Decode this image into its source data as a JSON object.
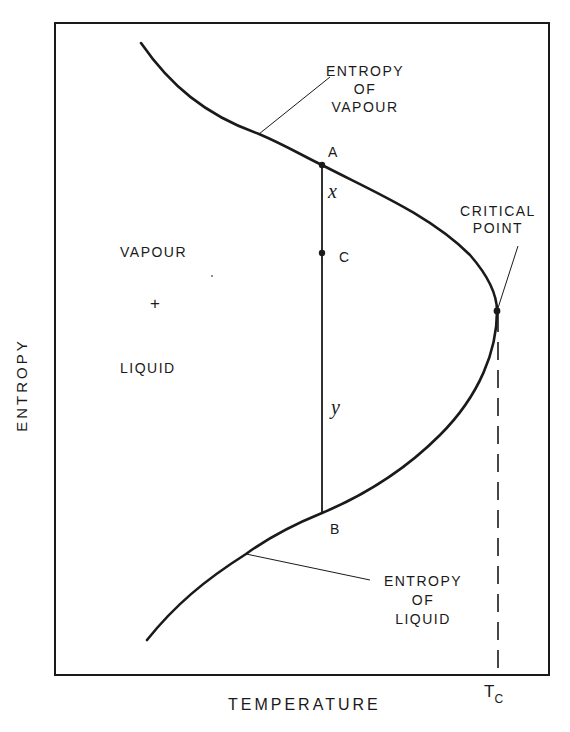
{
  "diagram": {
    "type": "temperature-entropy phase diagram",
    "axes": {
      "x_label": "TEMPERATURE",
      "y_label": "ENTROPY",
      "x_tick": {
        "main": "T",
        "subscript": "C"
      }
    },
    "regions": {
      "two_phase": {
        "line1": "VAPOUR",
        "line2": "+",
        "line3": "LIQUID"
      }
    },
    "curves": {
      "vapour": {
        "line1": "ENTROPY",
        "line2": "OF",
        "line3": "VAPOUR"
      },
      "liquid": {
        "line1": "ENTROPY",
        "line2": "OF",
        "line3": "LIQUID"
      }
    },
    "critical_point": {
      "line1": "CRITICAL",
      "line2": "POINT"
    },
    "points": {
      "A": "A",
      "B": "B",
      "C": "C"
    },
    "segments": {
      "x": "x",
      "y": "y"
    },
    "colors": {
      "ink": "#1a1a1a",
      "paper": "#ffffff"
    }
  }
}
